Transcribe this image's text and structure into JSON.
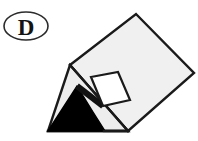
{
  "figure": {
    "option_label": "D",
    "caption": "",
    "background_color": "#ffffff",
    "stroke_color": "#1a1a1a",
    "body_fill": "#f0f0f0",
    "face_fill_light": "#ededed",
    "tip_fill": "#000000",
    "window_fill": "#ffffff",
    "label_badge": {
      "shape": "ellipse",
      "center_x": 26,
      "center_y": 26,
      "radius_x": 22,
      "radius_y": 14,
      "stroke_width": 1.6
    },
    "geometry": {
      "description": "Wedge / sharpened pencil prism drawn in oblique view, tip at lower-left, blunt cut end at upper-right",
      "outline_points": "70,65 136,14 194,73 128,131 48,131",
      "body_top_face": "70,65 136,14 194,73 128,131",
      "shaft_left_edge": "70,65 128,131",
      "tip_black_triangle": "48,131 77,86 93,112 105,131",
      "tip_gray_wedge": "70,65 48,131 105,131 93,112",
      "window_quad": "91,77 118,72 130,100 103,106",
      "bevel_line": "77,86 103,106",
      "base_line": "48,131 128,131"
    },
    "stroke_widths": {
      "outline": 2.4,
      "inner": 2.2,
      "window": 2.2
    }
  }
}
